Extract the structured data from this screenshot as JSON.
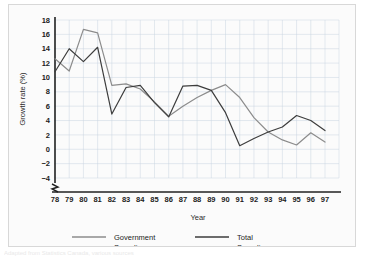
{
  "figure": {
    "background_color": "#fbfbfb",
    "border_color": "#d8d8d8"
  },
  "caption": {
    "text": "Adapted from Statistics Canada, various sources"
  },
  "chart_data": {
    "type": "line",
    "title": "",
    "xlabel": "Year",
    "ylabel": "Growth rate (%)",
    "x": [
      "78",
      "79",
      "80",
      "81",
      "82",
      "83",
      "84",
      "85",
      "86",
      "87",
      "88",
      "89",
      "90",
      "91",
      "92",
      "93",
      "94",
      "95",
      "96",
      "97"
    ],
    "xtick_labels": [
      "78",
      "79",
      "80",
      "81",
      "82",
      "83",
      "84",
      "85",
      "86",
      "87",
      "88",
      "89",
      "90",
      "91",
      "92",
      "93",
      "94",
      "95",
      "96",
      "97"
    ],
    "ytick_labels": [
      "-4",
      "-2",
      "0",
      "2",
      "4",
      "6",
      "8",
      "10",
      "12",
      "14",
      "16",
      "18"
    ],
    "ylim": [
      -4,
      18
    ],
    "ytick_step": 2,
    "grid": true,
    "grid_color": "#c9d4e0",
    "axis_break": true,
    "legend_position": "bottom",
    "series": [
      {
        "name": "Government Spending",
        "color": "#8c8c8c",
        "values": [
          12.6,
          10.9,
          16.7,
          16.2,
          8.9,
          9.1,
          8.4,
          6.6,
          4.6,
          6.0,
          7.2,
          8.2,
          9.0,
          7.2,
          4.4,
          2.4,
          1.3,
          0.6,
          2.3,
          1.0
        ]
      },
      {
        "name": "Total Spending",
        "color": "#3d3d3d",
        "values": [
          10.8,
          14.0,
          12.2,
          14.2,
          4.9,
          8.6,
          8.9,
          6.5,
          4.5,
          8.8,
          8.9,
          8.2,
          5.1,
          0.5,
          1.5,
          2.4,
          3.1,
          4.7,
          4.0,
          2.6
        ]
      }
    ],
    "series_rendering_note": "two overlapping polylines"
  },
  "legend": {
    "items": [
      {
        "label_line1": "Government",
        "label_line2": "Spending",
        "color": "#8c8c8c"
      },
      {
        "label_line1": "Total",
        "label_line2": "Spending",
        "color": "#3d3d3d"
      }
    ]
  }
}
